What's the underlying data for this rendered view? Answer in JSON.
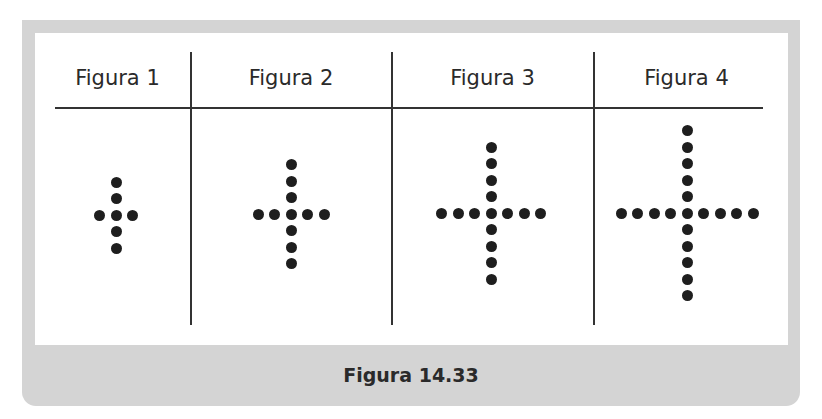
{
  "headers": [
    {
      "label": "Figura 1"
    },
    {
      "label": "Figura 2"
    },
    {
      "label": "Figura 3"
    },
    {
      "label": "Figura 4"
    }
  ],
  "caption": "Figura 14.33",
  "colors": {
    "frame": "#d4d4d4",
    "dot": "#1e1e1e",
    "line": "#333333"
  },
  "figures": [
    {
      "name": "Figura 1",
      "center": [
        116,
        215
      ],
      "up": 2,
      "down": 2,
      "left": 1,
      "right": 1,
      "total_dots": 7
    },
    {
      "name": "Figura 2",
      "center": [
        291,
        214
      ],
      "up": 3,
      "down": 3,
      "left": 2,
      "right": 2,
      "total_dots": 11
    },
    {
      "name": "Figura 3",
      "center": [
        491,
        213
      ],
      "up": 4,
      "down": 4,
      "left": 3,
      "right": 3,
      "total_dots": 15
    },
    {
      "name": "Figura 4",
      "center": [
        687,
        213
      ],
      "up": 5,
      "down": 5,
      "left": 4,
      "right": 4,
      "total_dots": 19
    }
  ],
  "dot_spacing": 16.5
}
